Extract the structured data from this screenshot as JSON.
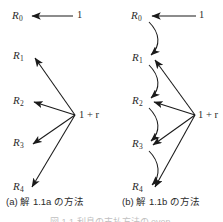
{
  "figure": {
    "type": "diagram",
    "background_color": "#ffffff",
    "stroke_color": "#1a1a1a",
    "panels": [
      {
        "id": "a",
        "caption": "(a) 解 1.1a の方法",
        "source_top_label": "1",
        "source_fan_label": "1 + r",
        "nodes": [
          {
            "id": "R0",
            "base": "R",
            "sub": "0"
          },
          {
            "id": "R1",
            "base": "R",
            "sub": "1"
          },
          {
            "id": "R2",
            "base": "R",
            "sub": "2"
          },
          {
            "id": "R3",
            "base": "R",
            "sub": "3"
          },
          {
            "id": "R4",
            "base": "R",
            "sub": "4"
          }
        ],
        "edges": [
          {
            "from": "1",
            "to": "R0",
            "style": "straight"
          },
          {
            "from": "1+r",
            "to": "R1",
            "style": "straight"
          },
          {
            "from": "1+r",
            "to": "R2",
            "style": "straight"
          },
          {
            "from": "1+r",
            "to": "R3",
            "style": "straight"
          },
          {
            "from": "1+r",
            "to": "R4",
            "style": "straight"
          }
        ]
      },
      {
        "id": "b",
        "caption": "(b) 解 1.1b の方法",
        "source_top_label": "1",
        "source_fan_label": "1 + r",
        "nodes": [
          {
            "id": "R0",
            "base": "R",
            "sub": "0"
          },
          {
            "id": "R1",
            "base": "R",
            "sub": "1"
          },
          {
            "id": "R2",
            "base": "R",
            "sub": "2"
          },
          {
            "id": "R3",
            "base": "R",
            "sub": "3"
          },
          {
            "id": "R4",
            "base": "R",
            "sub": "4"
          }
        ],
        "edges": [
          {
            "from": "1",
            "to": "R0",
            "style": "straight"
          },
          {
            "from": "R0",
            "to": "R1",
            "style": "curved"
          },
          {
            "from": "R1",
            "to": "R2",
            "style": "curved"
          },
          {
            "from": "R2",
            "to": "R3",
            "style": "curved"
          },
          {
            "from": "R3",
            "to": "R4",
            "style": "curved"
          },
          {
            "from": "1+r",
            "to": "R1",
            "style": "straight"
          },
          {
            "from": "1+r",
            "to": "R2",
            "style": "straight"
          },
          {
            "from": "1+r",
            "to": "R3",
            "style": "straight"
          },
          {
            "from": "1+r",
            "to": "R4",
            "style": "straight"
          }
        ]
      }
    ],
    "figure_number": "図 1.1  利息の支払方法の even"
  }
}
